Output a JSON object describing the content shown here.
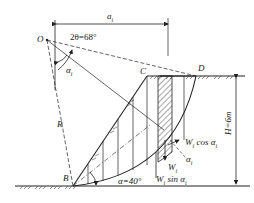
{
  "diagram": {
    "type": "slope-stability-slice-method",
    "labels": {
      "O": "O",
      "C": "C",
      "D": "D",
      "B": "B",
      "R": "R",
      "ai_dim": "a",
      "ai_sub": "i",
      "angle_2theta": "2θ=68°",
      "alpha_i": "α",
      "alpha_i_sub": "i",
      "alpha_slope": "α=40°",
      "height": "H=6m",
      "wcos": "W",
      "wcos_sub": "i",
      "wcos_rest": " cos α",
      "wcos_sub2": "i",
      "w": "W",
      "w_sub": "i",
      "wsin": "W",
      "wsin_sub": "i",
      "wsin_rest": " sin α",
      "wsin_sub2": "i",
      "alpha_force": "α",
      "alpha_force_sub": "i"
    },
    "colors": {
      "line": "#222222",
      "background": "#ffffff"
    }
  }
}
